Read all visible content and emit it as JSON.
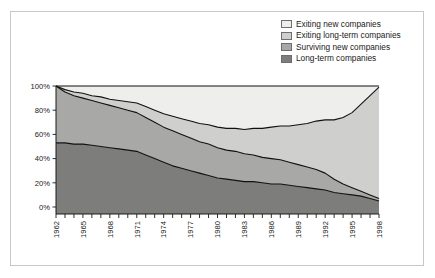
{
  "figure": {
    "border_color": "#c8c8c8",
    "background": "#ffffff"
  },
  "legend": {
    "items": [
      {
        "label": "Exiting new companies",
        "color": "#eeeeec"
      },
      {
        "label": "Exiting long-term companies",
        "color": "#cfcfcd"
      },
      {
        "label": "Surviving new companies",
        "color": "#a8a8a6"
      },
      {
        "label": "Long-term companies",
        "color": "#7d7d7b"
      }
    ]
  },
  "axes": {
    "y_ticks": [
      "0%",
      "20%",
      "40%",
      "60%",
      "80%",
      "100%"
    ],
    "x_ticks": [
      "1962",
      "1965",
      "1968",
      "1971",
      "1974",
      "1977",
      "1980",
      "1983",
      "1986",
      "1989",
      "1992",
      "1995",
      "1998"
    ]
  },
  "chart_data": {
    "type": "area",
    "title": "",
    "xlabel": "",
    "ylabel": "",
    "ylim": [
      0,
      100
    ],
    "xlim": [
      1962,
      1998
    ],
    "stacked": true,
    "stack_order": "bottom-to-top",
    "grid": false,
    "legend_position": "top-right",
    "x": [
      1962,
      1963,
      1964,
      1965,
      1966,
      1967,
      1968,
      1969,
      1970,
      1971,
      1972,
      1973,
      1974,
      1975,
      1976,
      1977,
      1978,
      1979,
      1980,
      1981,
      1982,
      1983,
      1984,
      1985,
      1986,
      1987,
      1988,
      1989,
      1990,
      1991,
      1992,
      1993,
      1994,
      1995,
      1996,
      1997,
      1998
    ],
    "series": [
      {
        "name": "Long-term companies",
        "color": "#7d7d7b",
        "values": [
          53,
          53,
          52,
          52,
          51,
          50,
          49,
          48,
          47,
          46,
          43,
          40,
          37,
          34,
          32,
          30,
          28,
          26,
          24,
          23,
          22,
          21,
          21,
          20,
          19,
          19,
          18,
          17,
          16,
          15,
          14,
          12,
          11,
          10,
          9,
          7,
          5
        ]
      },
      {
        "name": "Surviving new companies",
        "color": "#a8a8a6",
        "values": [
          47,
          42,
          40,
          38,
          37,
          36,
          35,
          34,
          33,
          32,
          31,
          30,
          29,
          29,
          28,
          27,
          26,
          26,
          25,
          24,
          24,
          23,
          22,
          21,
          21,
          20,
          19,
          18,
          17,
          16,
          14,
          11,
          8,
          6,
          4,
          3,
          2
        ]
      },
      {
        "name": "Exiting long-term companies",
        "color": "#cfcfcd",
        "values": [
          0,
          2,
          3,
          4,
          4,
          5,
          5,
          6,
          7,
          8,
          9,
          10,
          11,
          12,
          13,
          14,
          15,
          16,
          17,
          18,
          19,
          20,
          22,
          24,
          26,
          28,
          30,
          33,
          36,
          40,
          44,
          49,
          55,
          62,
          72,
          82,
          92
        ]
      },
      {
        "name": "Exiting new companies",
        "color": "#eeeeec",
        "values": [
          0,
          3,
          5,
          6,
          8,
          9,
          11,
          12,
          13,
          14,
          17,
          20,
          23,
          25,
          27,
          29,
          31,
          32,
          34,
          35,
          35,
          36,
          35,
          35,
          34,
          33,
          33,
          32,
          31,
          29,
          28,
          28,
          26,
          22,
          15,
          8,
          1
        ]
      }
    ]
  }
}
